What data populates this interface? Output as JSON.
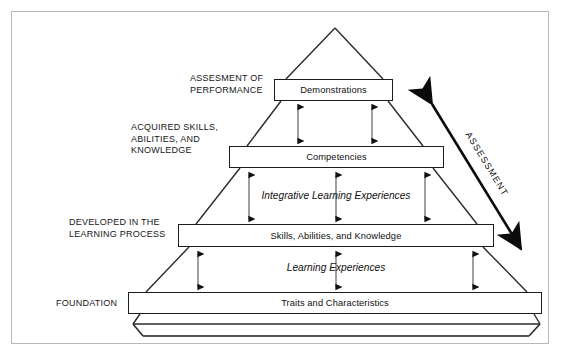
{
  "diagram": {
    "background_color": "#ffffff",
    "frame_color": "#b9b9b9",
    "line_color": "#1c1c1c",
    "tiers": [
      {
        "id": "demonstrations",
        "box_label": "Demonstrations",
        "side_label": "ASSESMENT OF\nPERFORMANCE",
        "level": 1
      },
      {
        "id": "competencies",
        "box_label": "Competencies",
        "side_label": "ACQUIRED SKILLS,\nABILITIES, AND\nKNOWLEDGE",
        "level": 2
      },
      {
        "id": "skills-abilities-knowledge",
        "box_label": "Skills, Abilities, and Knowledge",
        "side_label": "DEVELOPED IN THE\nLEARNING PROCESS",
        "level": 3
      },
      {
        "id": "traits-characteristics",
        "box_label": "Traits and Characteristics",
        "side_label": "FOUNDATION",
        "level": 4
      }
    ],
    "process_labels": [
      {
        "id": "integrative-learning-experiences",
        "text": "Integrative Learning Experiences",
        "between": "competencies-and-skills"
      },
      {
        "id": "learning-experiences",
        "text": "Learning Experiences",
        "between": "skills-and-traits"
      }
    ],
    "assessment_arrow": {
      "label": "ASSESSMENT",
      "direction": "double-headed",
      "orientation": "diagonal-descending-right"
    }
  }
}
